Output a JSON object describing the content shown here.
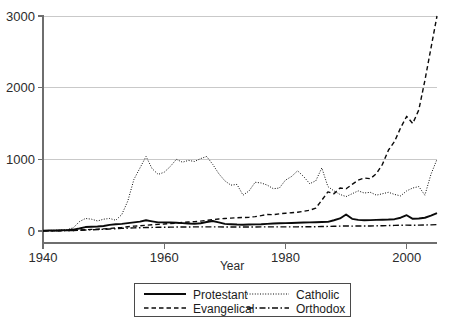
{
  "chart_data": {
    "type": "line",
    "title": "",
    "xlabel": "Year",
    "ylabel": "",
    "xlim": [
      1940,
      2005
    ],
    "ylim": [
      0,
      3000
    ],
    "grid": true,
    "legend_position": "bottom",
    "xticks": [
      1940,
      1960,
      1980,
      2000
    ],
    "yticks": [
      0,
      1000,
      2000,
      3000
    ],
    "x": [
      1940,
      1941,
      1942,
      1943,
      1944,
      1945,
      1946,
      1947,
      1948,
      1949,
      1950,
      1951,
      1952,
      1953,
      1954,
      1955,
      1956,
      1957,
      1958,
      1959,
      1960,
      1961,
      1962,
      1963,
      1964,
      1965,
      1966,
      1967,
      1968,
      1969,
      1970,
      1971,
      1972,
      1973,
      1974,
      1975,
      1976,
      1977,
      1978,
      1979,
      1980,
      1981,
      1982,
      1983,
      1984,
      1985,
      1986,
      1987,
      1988,
      1989,
      1990,
      1991,
      1992,
      1993,
      1994,
      1995,
      1996,
      1997,
      1998,
      1999,
      2000,
      2001,
      2002,
      2003,
      2004,
      2005
    ],
    "series": [
      {
        "name": "Protestant",
        "style": "solid",
        "values": [
          5,
          6,
          8,
          10,
          12,
          20,
          35,
          55,
          60,
          62,
          70,
          85,
          95,
          100,
          110,
          120,
          130,
          150,
          135,
          120,
          120,
          118,
          115,
          110,
          105,
          100,
          108,
          125,
          140,
          120,
          100,
          95,
          90,
          88,
          90,
          92,
          95,
          100,
          105,
          108,
          110,
          112,
          115,
          118,
          120,
          122,
          125,
          128,
          150,
          175,
          230,
          170,
          155,
          150,
          152,
          155,
          158,
          160,
          165,
          185,
          220,
          170,
          175,
          185,
          215,
          250
        ]
      },
      {
        "name": "Catholic",
        "style": "dotted",
        "values": [
          5,
          8,
          10,
          14,
          20,
          45,
          130,
          175,
          165,
          140,
          165,
          175,
          150,
          230,
          420,
          720,
          880,
          1040,
          870,
          790,
          820,
          900,
          1000,
          960,
          985,
          970,
          1010,
          1040,
          930,
          800,
          700,
          640,
          650,
          500,
          560,
          680,
          670,
          640,
          590,
          600,
          710,
          760,
          840,
          760,
          660,
          700,
          880,
          620,
          560,
          510,
          480,
          520,
          560,
          530,
          540,
          500,
          520,
          540,
          510,
          490,
          560,
          600,
          620,
          500,
          790,
          1000
        ]
      },
      {
        "name": "Evangelical",
        "style": "dashed",
        "values": [
          2,
          3,
          4,
          5,
          6,
          8,
          12,
          18,
          22,
          25,
          30,
          36,
          42,
          50,
          60,
          68,
          72,
          80,
          88,
          92,
          98,
          105,
          110,
          118,
          125,
          130,
          138,
          148,
          158,
          168,
          175,
          180,
          185,
          188,
          192,
          200,
          215,
          230,
          228,
          240,
          248,
          255,
          262,
          275,
          290,
          320,
          430,
          545,
          520,
          600,
          590,
          650,
          710,
          740,
          730,
          800,
          930,
          1130,
          1250,
          1440,
          1600,
          1500,
          1690,
          2100,
          2550,
          3000
        ]
      },
      {
        "name": "Orthodox",
        "style": "dashdot",
        "values": [
          1,
          2,
          3,
          4,
          5,
          7,
          10,
          14,
          18,
          20,
          24,
          28,
          32,
          36,
          40,
          44,
          46,
          48,
          50,
          52,
          52,
          54,
          55,
          56,
          56,
          58,
          58,
          58,
          58,
          58,
          56,
          56,
          56,
          56,
          56,
          56,
          58,
          58,
          58,
          58,
          58,
          58,
          58,
          60,
          60,
          60,
          62,
          64,
          66,
          68,
          70,
          68,
          70,
          70,
          70,
          72,
          74,
          76,
          78,
          80,
          82,
          80,
          82,
          84,
          86,
          90
        ]
      }
    ]
  },
  "legend": {
    "entries": [
      {
        "label": "Protestant",
        "style": "solid"
      },
      {
        "label": "Catholic",
        "style": "dotted"
      },
      {
        "label": "Evangelical",
        "style": "dashed"
      },
      {
        "label": "Orthodox",
        "style": "dashdot"
      }
    ]
  },
  "colors": {
    "line": "#0a0a0a",
    "grid": "#c9c9c9",
    "axis": "#6e6e6e",
    "text": "#2b2b2b",
    "background": "#ffffff"
  }
}
